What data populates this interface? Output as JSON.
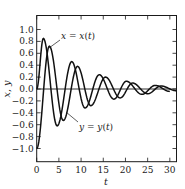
{
  "chart_data": {
    "type": "line",
    "title": "",
    "xlabel": "t",
    "ylabel": "x, y",
    "xlim": [
      0,
      31.5
    ],
    "ylim": [
      -1.27,
      1.27
    ],
    "xticks": [
      0,
      5,
      10,
      15,
      20,
      25,
      30
    ],
    "xtick_labels": [
      "0",
      "5",
      "10",
      "15",
      "20",
      "25",
      "30"
    ],
    "yticks": [
      1.0,
      0.8,
      0.6,
      0.4,
      0.2,
      0.0,
      -0.2,
      -0.4,
      -0.6,
      -0.8,
      -1.0
    ],
    "ytick_labels": [
      "1.0",
      "0.8",
      "0.6",
      "0.4",
      "0.2",
      "0.0",
      "-0.2",
      "-0.4",
      "-0.6",
      "-0.8",
      "-1.0"
    ],
    "grid": false,
    "zero_line": true,
    "legend": "none (inline annotations)",
    "annotations": [
      {
        "text": "x = x(t)",
        "points_to": "x(t) curve near t≈3, y≈0.6"
      },
      {
        "text": "y = y(t)",
        "points_to": "y(t) curve near t≈6.5, y≈-0.5"
      }
    ],
    "series": [
      {
        "name": "x = x(t)",
        "description": "damped oscillation starting at 0",
        "key_points": [
          {
            "t": 0,
            "v": 0.0
          },
          {
            "t": 1.5,
            "v": 0.85
          },
          {
            "t": 4.6,
            "v": -0.62
          },
          {
            "t": 7.9,
            "v": 0.46
          },
          {
            "t": 10.9,
            "v": -0.32
          },
          {
            "t": 14.1,
            "v": 0.24
          },
          {
            "t": 17.4,
            "v": -0.17
          },
          {
            "t": 20.2,
            "v": 0.13
          },
          {
            "t": 23.7,
            "v": -0.09
          },
          {
            "t": 26.7,
            "v": 0.06
          },
          {
            "t": 30,
            "v": -0.04
          }
        ]
      },
      {
        "name": "y = y(t)",
        "description": "damped oscillation starting at -1",
        "key_points": [
          {
            "t": 0,
            "v": -1.0
          },
          {
            "t": 2.85,
            "v": 0.72
          },
          {
            "t": 6.0,
            "v": -0.53
          },
          {
            "t": 9.2,
            "v": 0.38
          },
          {
            "t": 12.2,
            "v": -0.28
          },
          {
            "t": 15.5,
            "v": 0.2
          },
          {
            "t": 18.8,
            "v": -0.15
          },
          {
            "t": 21.6,
            "v": 0.1
          },
          {
            "t": 25.0,
            "v": -0.08
          },
          {
            "t": 28.0,
            "v": 0.05
          },
          {
            "t": 31.5,
            "v": -0.03
          }
        ]
      }
    ]
  },
  "labels": {
    "x_annotation": "x = x(t)",
    "y_annotation": "y = y(t)",
    "xlabel": "t",
    "ylabel": "x, y"
  }
}
